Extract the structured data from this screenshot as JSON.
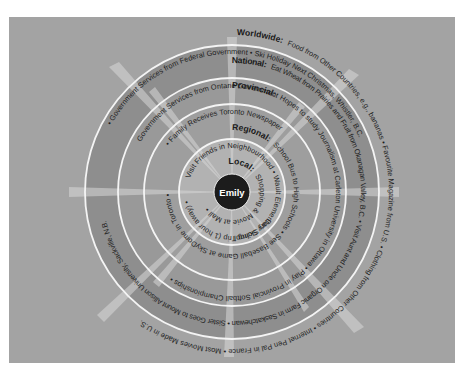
{
  "diagram": {
    "type": "concentric-circles",
    "center": {
      "label": "Emily"
    },
    "colors": {
      "background": "#a3a3a3",
      "outer_band": "#8c8c8c",
      "national_band": "#969696",
      "provincial_band": "#9b9b9b",
      "regional_band": "#a2a2a2",
      "local_band": "#b4b4b4",
      "ring_line": "#f2f2f2",
      "center_fill": "#1c1c1c",
      "rays": "#d9d9d9",
      "text": "#1e1e1e"
    },
    "rings": [
      {
        "level": "Local",
        "label": "Local:",
        "items": [
          "Shopping & Movie at Mall",
          "Visit Friends in Neighbourhood",
          "Wault Elementary School"
        ],
        "top_text": "Visit Friends in Neighbourhood • Wault Elementary School",
        "inner_text": "Shopping & Movie at Mall"
      },
      {
        "level": "Regional",
        "label": "Regional:",
        "items": [
          "School Bus to High Schools",
          "Day Skiing Trip (1 hour away)",
          "Government Services from Local Government",
          "Family Receives Toronto Newspaper"
        ],
        "top_text": "Government Services from Local Government • Family Receives Toronto Newspaper",
        "inner_text": "School Bus to High Schools • Day Skiing Trip (1 hour away) •"
      },
      {
        "level": "Provincial",
        "label": "Provincial:",
        "items": [
          "Hopes to study Journalism at Carleton University in Ottawa",
          "See Baseball Game at SkyDome in Toronto",
          "Government Services from Ontario Government",
          "Play in Provincial Softball Championships"
        ],
        "top_text": "Government Services from Ontario Government",
        "inner_text": "See Baseball Game at SkyDome in Toronto • Play in Provincial Softball Championships •"
      },
      {
        "level": "National",
        "label": "National:",
        "items": [
          "Eat Wheat from Prairies and Fruit from Okanagan Valley, B.C.",
          "Visit Aunt and Uncle on Organic Farm in Saskatchewan",
          "Sister Goes to Mount Allison University, Sackville, N.B.",
          "Government Services from Federal Government",
          "Ski Holiday Next Christmas, Whistler, B.C."
        ],
        "top_text": "Government Services from Federal Government • Ski Holiday Next Christmas, Whistler, B.C.",
        "inner_text": "Hopes to study Journalism at Carleton University in Ottawa • Visit Aunt and Uncle on Organic Farm in Saskatchewan • Sister Goes to Mount Allison University, Sackville, N.B."
      },
      {
        "level": "Worldwide",
        "label": "Worldwide:",
        "items": [
          "Food from Other Countries, e.g., bananas",
          "Favourite Magazine from U.S.",
          "Clothing from Other Countries",
          "Internet Pen Pal in France",
          "Most Movies Made in U.S."
        ],
        "outer_text": "Food from Other Countries, e.g., bananas • Favourite Magazine from U.S. • Clothing from Other Countries • Internet Pen Pal in France • Most Movies Made in U.S."
      }
    ],
    "text_paths": {
      "worldwide_label": "Worldwide:",
      "worldwide_run": "Food from Other Countries, e.g., bananas  •  Favourite Magazine from U.S.  •  Clothing from Other Countries  •  Internet Pen Pal in France  •  Most Movies Made in U.S.",
      "national_top": "•  Government Services from Federal Government  •  Ski Holiday Next Christmas, Whistler, B.C.",
      "national_label": "National:",
      "national_run": "Eat Wheat from Prairies and Fruit from Okanagan Valley, B.C.  •  Visit Aunt and Uncle on Organic Farm in Saskatchewan  •  Sister Goes to Mount Allison University, Sackville, N.B.",
      "provincial_top": "Government Services from Ontario Government",
      "provincial_label": "Provincial:",
      "provincial_run": "Hopes to study Journalism at Carleton University in Ottawa  •  Play in Provincial Softball Championships  •",
      "regional_top": "•  Family Receives Toronto Newspaper",
      "regional_label": "Regional:",
      "regional_run": "School Bus to High Schools  •  See Baseball Game at SkyDome in Toronto  •  Government Services from Local Government",
      "local_top": "Visit Friends in Neighbourhood  •  Wault Elementary School",
      "local_label": "Local:",
      "local_run": "Shopping & Movie at Mall  •",
      "regional_inner": "Day Skiing Trip (1 hour away)  •",
      "center": "Emily"
    }
  }
}
